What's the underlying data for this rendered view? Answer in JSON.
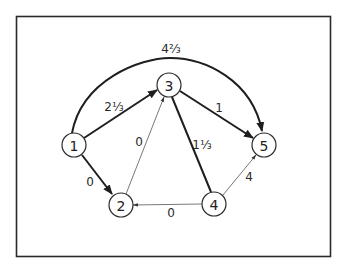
{
  "diagram": {
    "type": "directed-graph",
    "nodes": [
      {
        "id": "1",
        "label": "1",
        "x": 74,
        "y": 145
      },
      {
        "id": "2",
        "label": "2",
        "x": 121,
        "y": 205
      },
      {
        "id": "3",
        "label": "3",
        "x": 169,
        "y": 85
      },
      {
        "id": "4",
        "label": "4",
        "x": 214,
        "y": 204
      },
      {
        "id": "5",
        "label": "5",
        "x": 264,
        "y": 145
      }
    ],
    "edges": [
      {
        "from": "1",
        "to": "3",
        "label": "2⅓",
        "weight": "heavy"
      },
      {
        "from": "1",
        "to": "5",
        "label": "4⅔",
        "weight": "heavy",
        "shape": "arc"
      },
      {
        "from": "1",
        "to": "2",
        "label": "0",
        "weight": "heavy"
      },
      {
        "from": "2",
        "to": "3",
        "label": "0",
        "weight": "light"
      },
      {
        "from": "3",
        "to": "5",
        "label": "1",
        "weight": "heavy"
      },
      {
        "from": "3",
        "to": "4",
        "label": "1⅓",
        "weight": "heavy",
        "arrow": false
      },
      {
        "from": "4",
        "to": "2",
        "label": "0",
        "weight": "light"
      },
      {
        "from": "4",
        "to": "5",
        "label": "4",
        "weight": "light"
      }
    ]
  },
  "labels": {
    "n1": "1",
    "n2": "2",
    "n3": "3",
    "n4": "4",
    "n5": "5",
    "e13": "2⅓",
    "e15": "4⅔",
    "e12": "0",
    "e23": "0",
    "e35": "1",
    "e34": "1⅓",
    "e42": "0",
    "e45": "4"
  },
  "colors": {
    "ink": "#222222",
    "background": "#ffffff"
  }
}
